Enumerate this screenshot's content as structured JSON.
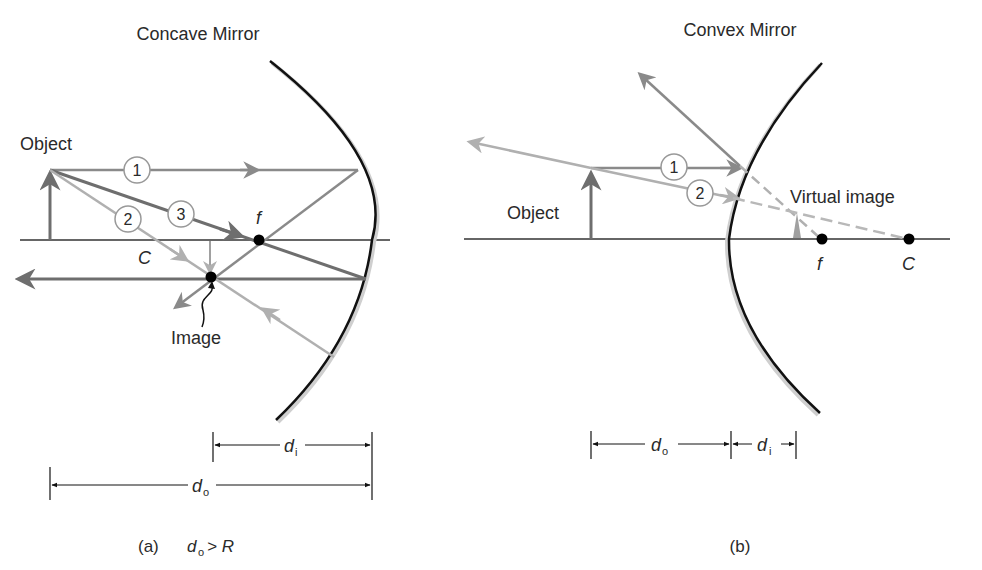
{
  "panel_a": {
    "title": "Concave Mirror",
    "object_label": "Object",
    "image_label": "Image",
    "ray_labels": [
      "1",
      "2",
      "3"
    ],
    "point_f": "f",
    "point_c": "C",
    "dim_di": "d",
    "dim_di_sub": "i",
    "dim_do": "d",
    "dim_do_sub": "o",
    "caption_prefix": "(a)",
    "caption_d": "d",
    "caption_sub": "o",
    "caption_rest": " > R"
  },
  "panel_b": {
    "title": "Convex Mirror",
    "object_label": "Object",
    "virtual_image_label": "Virtual image",
    "ray_labels": [
      "1",
      "2"
    ],
    "point_f": "f",
    "point_c": "C",
    "dim_do": "d",
    "dim_do_sub": "o",
    "dim_di": "d",
    "dim_di_sub": "i",
    "caption": "(b)"
  },
  "colors": {
    "mirror": "#111111",
    "axis": "#333333",
    "ray_dark": "#6e6e6e",
    "ray_mid": "#8a8a8a",
    "ray_light": "#b0b0b0",
    "dashed": "#b8b8b8",
    "text": "#2a2a2a"
  }
}
